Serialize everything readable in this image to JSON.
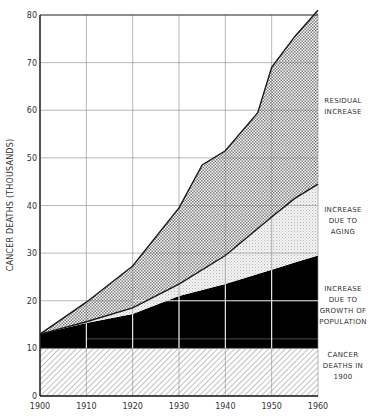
{
  "chart_data": {
    "type": "area",
    "stacked": true,
    "title": "",
    "xlabel": "",
    "ylabel": "CANCER DEATHS (THOUSANDS)",
    "xlim": [
      1900,
      1960
    ],
    "ylim": [
      0,
      80
    ],
    "x_ticks": [
      "1900",
      "1910",
      "1920",
      "1930",
      "1940",
      "1950",
      "1960"
    ],
    "y_ticks": [
      "0",
      "10",
      "20",
      "30",
      "40",
      "50",
      "60",
      "70",
      "80"
    ],
    "grid": true,
    "legend_position": "right (inline labels beside each band)",
    "boundaries": {
      "baseline_1900": {
        "x": [
          1900,
          1960
        ],
        "y": [
          10,
          10
        ]
      },
      "population": {
        "x": [
          1900,
          1910,
          1920,
          1930,
          1940,
          1950,
          1960
        ],
        "y": [
          13,
          15.3,
          17.2,
          21,
          23.5,
          26.5,
          29.5
        ]
      },
      "aging": {
        "x": [
          1900,
          1910,
          1920,
          1930,
          1940,
          1950,
          1955,
          1960
        ],
        "y": [
          13,
          15.6,
          18.5,
          23.5,
          29.5,
          37.6,
          41.5,
          44.5
        ]
      },
      "total": {
        "x": [
          1900,
          1910,
          1920,
          1930,
          1935,
          1940,
          1947,
          1950,
          1955,
          1960
        ],
        "y": [
          13,
          19.7,
          27.3,
          39.5,
          48.5,
          51.5,
          59.5,
          69,
          75.5,
          81
        ]
      }
    },
    "series": [
      {
        "name": "CANCER DEATHS IN 1900",
        "fill": "diagonal-hatch",
        "lower": "zero",
        "upper": "baseline_1900"
      },
      {
        "name": "INCREASE DUE TO GROWTH OF POPULATION",
        "fill": "solid-black",
        "lower": "baseline_1900",
        "upper": "population"
      },
      {
        "name": "INCREASE DUE TO AGING",
        "fill": "light-stipple",
        "lower": "population",
        "upper": "aging"
      },
      {
        "name": "RESIDUAL INCREASE",
        "fill": "crosshatch",
        "lower": "aging",
        "upper": "total"
      }
    ]
  },
  "legend": {
    "residual": "RESIDUAL\nINCREASE",
    "aging": "INCREASE\nDUE TO\nAGING",
    "population": "INCREASE\nDUE TO\nGROWTH OF\nPOPULATION",
    "baseline": "CANCER\nDEATHS IN\n1900"
  },
  "colors": {
    "line": "#1a1a1a",
    "grid": "#8a8a8a",
    "population_fill": "#000000",
    "hatch": "#8c8c8c",
    "crosshatch": "#7a7a7a",
    "stipple": "#bdbdbd"
  }
}
